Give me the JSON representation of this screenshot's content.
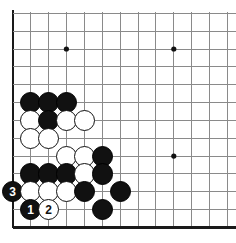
{
  "diagram": {
    "kind": "go-board-diagram",
    "board_region": "lower-left corner",
    "columns": 13,
    "rows": 13,
    "grid_origin_x": 12.7,
    "grid_origin_y": 13.3,
    "grid_step_x": 17.9,
    "grid_step_y": 17.85,
    "stone_radius": 10.6,
    "colors": {
      "background": "#ffffff",
      "grid_line": "#8a8a8a",
      "edge_line": "#1a1a1a",
      "black_stone": "#111111",
      "white_stone": "#ffffff",
      "white_stone_outline": "#111111",
      "star_point": "#111111"
    },
    "edges": {
      "left": true,
      "bottom": true,
      "top": false,
      "right": false
    },
    "star_points": [
      {
        "col": 3,
        "row": 2
      },
      {
        "col": 9,
        "row": 2
      },
      {
        "col": 9,
        "row": 8
      }
    ],
    "stones": [
      {
        "col": 1,
        "row": 5,
        "color": "black",
        "label": ""
      },
      {
        "col": 2,
        "row": 5,
        "color": "black",
        "label": ""
      },
      {
        "col": 3,
        "row": 5,
        "color": "black",
        "label": ""
      },
      {
        "col": 1,
        "row": 6,
        "color": "white",
        "label": ""
      },
      {
        "col": 2,
        "row": 6,
        "color": "black",
        "label": ""
      },
      {
        "col": 3,
        "row": 6,
        "color": "white",
        "label": ""
      },
      {
        "col": 4,
        "row": 6,
        "color": "white",
        "label": ""
      },
      {
        "col": 1,
        "row": 7,
        "color": "white",
        "label": ""
      },
      {
        "col": 2,
        "row": 7,
        "color": "white",
        "label": ""
      },
      {
        "col": 3,
        "row": 8,
        "color": "white",
        "label": ""
      },
      {
        "col": 4,
        "row": 8,
        "color": "white",
        "label": ""
      },
      {
        "col": 5,
        "row": 8,
        "color": "black",
        "label": ""
      },
      {
        "col": 1,
        "row": 9,
        "color": "black",
        "label": ""
      },
      {
        "col": 2,
        "row": 9,
        "color": "black",
        "label": ""
      },
      {
        "col": 3,
        "row": 9,
        "color": "black",
        "label": ""
      },
      {
        "col": 4,
        "row": 9,
        "color": "white",
        "label": ""
      },
      {
        "col": 5,
        "row": 9,
        "color": "black",
        "label": ""
      },
      {
        "col": 0,
        "row": 10,
        "color": "black",
        "label": "3"
      },
      {
        "col": 1,
        "row": 10,
        "color": "white",
        "label": ""
      },
      {
        "col": 2,
        "row": 10,
        "color": "white",
        "label": ""
      },
      {
        "col": 3,
        "row": 10,
        "color": "white",
        "label": ""
      },
      {
        "col": 4,
        "row": 10,
        "color": "black",
        "label": ""
      },
      {
        "col": 6,
        "row": 10,
        "color": "black",
        "label": ""
      },
      {
        "col": 1,
        "row": 11,
        "color": "black",
        "label": "1"
      },
      {
        "col": 2,
        "row": 11,
        "color": "white",
        "label": "2"
      },
      {
        "col": 5,
        "row": 11,
        "color": "black",
        "label": ""
      }
    ],
    "move_sequence": [
      {
        "number": "1",
        "color": "black"
      },
      {
        "number": "2",
        "color": "white"
      },
      {
        "number": "3",
        "color": "black"
      }
    ]
  }
}
